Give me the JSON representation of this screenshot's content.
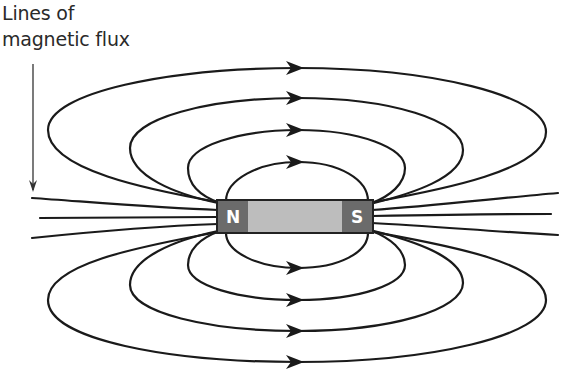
{
  "diagram": {
    "label": {
      "line1": "Lines of",
      "line2": "magnetic flux"
    },
    "magnet": {
      "north_label": "N",
      "south_label": "S",
      "pole_color": "#6b6b6b",
      "body_color": "#bdbdbd",
      "outline_color": "#222222"
    },
    "field_lines": {
      "closed_loops_above": 4,
      "closed_loops_below": 4,
      "open_lines_each_side": 3,
      "arrow_direction": "left-to-right (N to S outside magnet)",
      "line_color": "#1a1a1a"
    }
  }
}
